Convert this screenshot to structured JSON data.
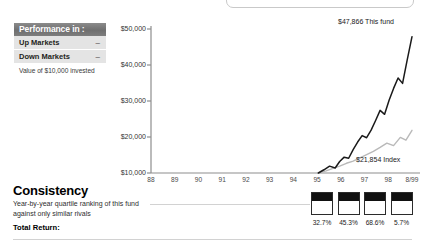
{
  "performance_panel": {
    "header": "Performance in :",
    "rows": [
      {
        "label": "Up Markets",
        "value": "–"
      },
      {
        "label": "Down Markets",
        "value": "–"
      }
    ],
    "caption": "Value of $10,000 invested"
  },
  "consistency": {
    "title": "Consistency",
    "subtitle": "Year-by-year quartile ranking of this fund against only similar rivals",
    "total_return_label": "Total Return:",
    "quartiles": [
      {
        "year": "96",
        "percent": "32.7%"
      },
      {
        "year": "97",
        "percent": "45.3%"
      },
      {
        "year": "98",
        "percent": "68.6%"
      },
      {
        "year": "8/99",
        "percent": "5.7%"
      }
    ]
  },
  "chart_data": {
    "type": "line",
    "title": "",
    "xlabel": "",
    "ylabel": "",
    "grid": false,
    "ylim": [
      10000,
      50000
    ],
    "ytick_labels": [
      "$10,000",
      "$20,000",
      "$30,000",
      "$40,000",
      "$50,000"
    ],
    "ytick_values": [
      10000,
      20000,
      30000,
      40000,
      50000
    ],
    "xtick_labels": [
      "88",
      "89",
      "90",
      "91",
      "92",
      "93",
      "94",
      "95",
      "96",
      "97",
      "98",
      "8/99"
    ],
    "annotations": [
      {
        "text": "$47,866 This fund",
        "value": 47866
      },
      {
        "text": "$21,854 Index",
        "value": 21854
      }
    ],
    "series": [
      {
        "name": "This fund",
        "color": "#1a1a1a",
        "final_value": 47866,
        "x": [
          95.45,
          95.7,
          95.95,
          96.2,
          96.4,
          96.6,
          96.8,
          97.0,
          97.2,
          97.4,
          97.6,
          97.8,
          98.0,
          98.2,
          98.4,
          98.6,
          98.8,
          99.0,
          99.2,
          99.4,
          99.62
        ],
        "values": [
          10000,
          10900,
          11900,
          11400,
          13200,
          14400,
          14100,
          16500,
          18600,
          20400,
          19800,
          21900,
          24600,
          27400,
          26300,
          30200,
          33500,
          36400,
          34900,
          41200,
          47866
        ]
      },
      {
        "name": "Index",
        "color": "#b9b9b9",
        "final_value": 21854,
        "x": [
          95.45,
          95.8,
          96.1,
          96.4,
          96.7,
          97.0,
          97.3,
          97.6,
          97.9,
          98.2,
          98.5,
          98.8,
          99.1,
          99.35,
          99.62
        ],
        "values": [
          10000,
          10600,
          11300,
          11900,
          12700,
          13300,
          14200,
          15100,
          16000,
          17100,
          18300,
          17600,
          19900,
          19100,
          21854
        ]
      }
    ]
  }
}
